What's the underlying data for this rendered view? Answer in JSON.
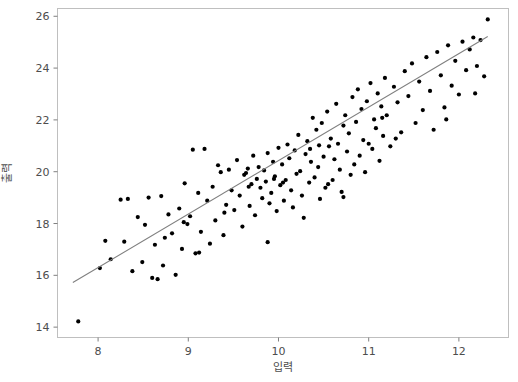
{
  "chart_data": {
    "type": "scatter",
    "title": "",
    "xlabel": "입력",
    "ylabel": "출력",
    "xlim": [
      7.55,
      12.55
    ],
    "ylim": [
      13.6,
      26.3
    ],
    "xticks": [
      8,
      9,
      10,
      11,
      12
    ],
    "xtick_labels": [
      "8",
      "9",
      "10",
      "11",
      "12"
    ],
    "yticks": [
      14,
      16,
      18,
      20,
      22,
      24,
      26
    ],
    "ytick_labels": [
      "14",
      "16",
      "18",
      "20",
      "22",
      "24",
      "26"
    ],
    "grid": false,
    "legend": null,
    "point_color": "#000000",
    "point_size": 2.1,
    "trend_line": {
      "type": "linear-fit",
      "color": "#808080",
      "x_start": 7.72,
      "y_start": 15.72,
      "x_end": 12.32,
      "y_end": 25.22
    },
    "points": [
      [
        7.78,
        14.22
      ],
      [
        8.02,
        16.28
      ],
      [
        8.08,
        17.33
      ],
      [
        8.14,
        16.62
      ],
      [
        8.25,
        18.92
      ],
      [
        8.29,
        17.3
      ],
      [
        8.33,
        18.95
      ],
      [
        8.38,
        16.16
      ],
      [
        8.44,
        18.25
      ],
      [
        8.49,
        16.51
      ],
      [
        8.52,
        17.95
      ],
      [
        8.56,
        19.0
      ],
      [
        8.6,
        15.9
      ],
      [
        8.63,
        17.18
      ],
      [
        8.66,
        15.85
      ],
      [
        8.7,
        19.06
      ],
      [
        8.74,
        17.45
      ],
      [
        8.78,
        18.35
      ],
      [
        8.82,
        17.62
      ],
      [
        8.86,
        16.02
      ],
      [
        8.9,
        18.58
      ],
      [
        8.93,
        17.02
      ],
      [
        8.96,
        19.55
      ],
      [
        8.99,
        17.98
      ],
      [
        9.02,
        18.28
      ],
      [
        9.05,
        20.85
      ],
      [
        9.08,
        16.85
      ],
      [
        9.11,
        19.18
      ],
      [
        9.14,
        17.68
      ],
      [
        9.18,
        20.88
      ],
      [
        9.21,
        18.88
      ],
      [
        9.24,
        17.22
      ],
      [
        9.27,
        19.42
      ],
      [
        9.3,
        18.12
      ],
      [
        9.33,
        20.25
      ],
      [
        9.36,
        19.98
      ],
      [
        9.39,
        17.55
      ],
      [
        9.42,
        18.72
      ],
      [
        9.45,
        20.08
      ],
      [
        9.48,
        19.28
      ],
      [
        9.51,
        18.52
      ],
      [
        9.54,
        20.45
      ],
      [
        9.57,
        19.08
      ],
      [
        9.6,
        17.88
      ],
      [
        9.62,
        19.88
      ],
      [
        9.64,
        19.95
      ],
      [
        9.66,
        20.12
      ],
      [
        9.68,
        18.68
      ],
      [
        9.7,
        19.52
      ],
      [
        9.72,
        20.62
      ],
      [
        9.74,
        18.32
      ],
      [
        9.76,
        19.72
      ],
      [
        9.78,
        20.18
      ],
      [
        9.8,
        19.38
      ],
      [
        9.82,
        18.98
      ],
      [
        9.84,
        20.05
      ],
      [
        9.86,
        19.62
      ],
      [
        9.88,
        20.72
      ],
      [
        9.9,
        18.78
      ],
      [
        9.92,
        19.18
      ],
      [
        9.94,
        20.38
      ],
      [
        9.96,
        19.82
      ],
      [
        9.98,
        18.48
      ],
      [
        10.0,
        20.92
      ],
      [
        10.02,
        19.48
      ],
      [
        10.04,
        20.28
      ],
      [
        10.06,
        18.88
      ],
      [
        10.08,
        19.68
      ],
      [
        10.1,
        21.05
      ],
      [
        10.12,
        20.52
      ],
      [
        10.14,
        19.28
      ],
      [
        10.16,
        18.62
      ],
      [
        10.18,
        20.82
      ],
      [
        10.2,
        19.92
      ],
      [
        10.22,
        21.42
      ],
      [
        10.24,
        20.02
      ],
      [
        10.26,
        19.08
      ],
      [
        10.28,
        18.22
      ],
      [
        10.3,
        20.68
      ],
      [
        10.32,
        21.18
      ],
      [
        10.34,
        19.58
      ],
      [
        10.36,
        20.38
      ],
      [
        10.38,
        22.08
      ],
      [
        10.4,
        19.78
      ],
      [
        10.42,
        21.62
      ],
      [
        10.44,
        20.18
      ],
      [
        10.46,
        18.95
      ],
      [
        10.48,
        21.88
      ],
      [
        10.5,
        20.58
      ],
      [
        10.52,
        19.38
      ],
      [
        10.54,
        22.32
      ],
      [
        10.56,
        20.98
      ],
      [
        10.58,
        21.28
      ],
      [
        10.6,
        19.68
      ],
      [
        10.62,
        20.48
      ],
      [
        10.64,
        22.62
      ],
      [
        10.66,
        21.08
      ],
      [
        10.68,
        20.08
      ],
      [
        10.7,
        19.22
      ],
      [
        10.72,
        21.78
      ],
      [
        10.74,
        22.18
      ],
      [
        10.76,
        20.78
      ],
      [
        10.78,
        21.48
      ],
      [
        10.8,
        19.88
      ],
      [
        10.82,
        22.88
      ],
      [
        10.84,
        20.28
      ],
      [
        10.86,
        21.92
      ],
      [
        10.88,
        23.18
      ],
      [
        10.9,
        20.62
      ],
      [
        10.92,
        22.42
      ],
      [
        10.94,
        21.22
      ],
      [
        10.96,
        19.98
      ],
      [
        10.98,
        22.72
      ],
      [
        11.0,
        21.08
      ],
      [
        11.02,
        23.42
      ],
      [
        11.04,
        20.88
      ],
      [
        11.06,
        22.02
      ],
      [
        11.08,
        21.68
      ],
      [
        11.1,
        23.02
      ],
      [
        11.12,
        20.42
      ],
      [
        11.14,
        22.52
      ],
      [
        11.16,
        21.38
      ],
      [
        11.18,
        23.62
      ],
      [
        11.2,
        22.18
      ],
      [
        11.24,
        20.98
      ],
      [
        11.28,
        23.28
      ],
      [
        11.32,
        22.68
      ],
      [
        11.36,
        21.52
      ],
      [
        11.4,
        23.88
      ],
      [
        11.44,
        22.92
      ],
      [
        11.48,
        24.18
      ],
      [
        11.52,
        21.88
      ],
      [
        11.56,
        23.48
      ],
      [
        11.6,
        22.38
      ],
      [
        11.64,
        24.42
      ],
      [
        11.68,
        23.12
      ],
      [
        11.72,
        21.62
      ],
      [
        11.76,
        24.62
      ],
      [
        11.8,
        23.72
      ],
      [
        11.84,
        22.48
      ],
      [
        11.88,
        24.88
      ],
      [
        11.92,
        23.32
      ],
      [
        11.96,
        24.28
      ],
      [
        12.0,
        22.98
      ],
      [
        12.04,
        25.02
      ],
      [
        12.08,
        23.92
      ],
      [
        12.12,
        24.72
      ],
      [
        12.16,
        25.18
      ],
      [
        12.2,
        24.08
      ],
      [
        12.24,
        25.08
      ],
      [
        12.28,
        23.68
      ],
      [
        12.32,
        25.88
      ],
      [
        9.95,
        19.72
      ],
      [
        10.05,
        19.58
      ],
      [
        9.67,
        19.42
      ],
      [
        10.45,
        21.02
      ],
      [
        11.15,
        22.08
      ],
      [
        10.35,
        20.88
      ],
      [
        9.4,
        18.42
      ],
      [
        8.95,
        18.05
      ],
      [
        11.3,
        21.28
      ],
      [
        10.55,
        19.52
      ],
      [
        9.88,
        17.28
      ],
      [
        10.72,
        19.02
      ],
      [
        11.86,
        22.02
      ],
      [
        12.18,
        23.02
      ],
      [
        9.12,
        16.88
      ],
      [
        8.72,
        16.38
      ]
    ]
  }
}
